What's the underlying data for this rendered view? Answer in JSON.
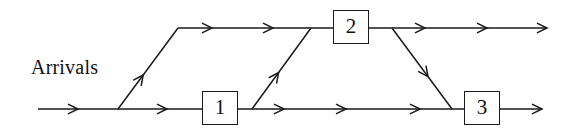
{
  "diagram": {
    "title_text": "Arrivals",
    "line_color": "#1a1a1a",
    "background_color": "#ffffff",
    "nodes": [
      {
        "id": "node-1",
        "label": "1",
        "x": 202,
        "y": 91,
        "w": 36,
        "h": 34
      },
      {
        "id": "node-2",
        "label": "2",
        "x": 333,
        "y": 10,
        "w": 36,
        "h": 34
      },
      {
        "id": "node-3",
        "label": "3",
        "x": 464,
        "y": 91,
        "w": 36,
        "h": 34
      }
    ],
    "edges": [
      {
        "name": "arrivals-entry-segment",
        "from": [
          38,
          109
        ],
        "to": [
          118,
          109
        ],
        "arrows": [
          78
        ]
      },
      {
        "name": "branch-up-to-top-lane",
        "from": [
          118,
          109
        ],
        "to": [
          178,
          28
        ],
        "arrows": [
          0.42
        ]
      },
      {
        "name": "lower-lane-to-node-1",
        "from": [
          118,
          109
        ],
        "to": [
          202,
          109
        ],
        "arrows": [
          167
        ]
      },
      {
        "name": "top-lane-to-node-2",
        "from": [
          178,
          28
        ],
        "to": [
          333,
          28
        ],
        "arrows": [
          212,
          273
        ]
      },
      {
        "name": "node-1-to-node-3-lane",
        "from": [
          238,
          109
        ],
        "to": [
          464,
          109
        ],
        "arrows": [
          284,
          346,
          420
        ]
      },
      {
        "name": "branch-up-to-node-2",
        "from": [
          252,
          109
        ],
        "to": [
          311,
          28
        ],
        "arrows": [
          0.45
        ]
      },
      {
        "name": "node-2-to-exit",
        "from": [
          369,
          28
        ],
        "to": [
          547,
          28
        ],
        "arrows": [
          425,
          487
        ]
      },
      {
        "name": "node-2-down-to-node-3",
        "from": [
          392,
          28
        ],
        "to": [
          452,
          109
        ],
        "arrows": [
          0.6
        ]
      },
      {
        "name": "node-3-to-exit",
        "from": [
          500,
          109
        ],
        "to": [
          542,
          109
        ],
        "arrows": []
      }
    ],
    "terminal_arrows": [
      {
        "name": "top-exit-arrowhead",
        "x": 547,
        "y": 28
      },
      {
        "name": "bottom-exit-arrowhead",
        "x": 542,
        "y": 109
      }
    ]
  }
}
